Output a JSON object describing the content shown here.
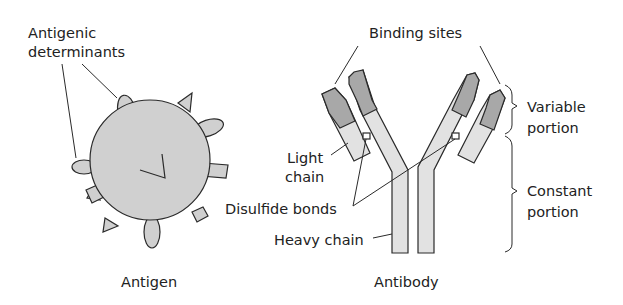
{
  "diagram": {
    "antigen": {
      "caption": "Antigen",
      "label_line1": "Antigenic",
      "label_line2": "determinants"
    },
    "antibody": {
      "caption": "Antibody",
      "binding_sites": "Binding sites",
      "light_chain_line1": "Light",
      "light_chain_line2": "chain",
      "disulfide_bonds": "Disulfide bonds",
      "heavy_chain": "Heavy chain",
      "variable_line1": "Variable",
      "variable_line2": "portion",
      "constant_line1": "Constant",
      "constant_line2": "portion"
    },
    "colors": {
      "antigen_fill": "#d0d0d0",
      "constant_fill": "#e2e2e2",
      "variable_fill": "#a8a8a8",
      "outline": "#2a2a2a"
    }
  }
}
